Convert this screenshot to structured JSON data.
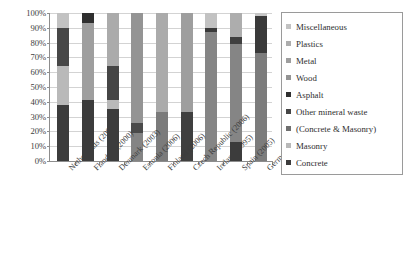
{
  "chart_data": {
    "type": "bar",
    "subtype": "stacked-100-percent",
    "title": "",
    "xlabel": "",
    "ylabel": "",
    "ylim": [
      0,
      100
    ],
    "y_unit": "%",
    "grid": true,
    "legend_position": "right",
    "y_ticks": [
      "0%",
      "10%",
      "20%",
      "30%",
      "40%",
      "50%",
      "60%",
      "70%",
      "80%",
      "90%",
      "100%"
    ],
    "y_tick_values": [
      0,
      10,
      20,
      30,
      40,
      50,
      60,
      70,
      80,
      90,
      100
    ],
    "categories": [
      "Netherlands (2001)",
      "Flanders (2000)",
      "Denmark (2003)",
      "Estonia (2006)",
      "Finland (2006)",
      "Czech Republic (2006)",
      "Ireland (1995)",
      "Spain (2005)",
      "Germany (2007)"
    ],
    "series": [
      {
        "name": "Concrete",
        "color": "#3b3b3b",
        "values": [
          38,
          41,
          35,
          0,
          0,
          33,
          0,
          13,
          0
        ]
      },
      {
        "name": "Masonry",
        "color": "#b7b7b7",
        "values": [
          26,
          0,
          6,
          0,
          0,
          0,
          0,
          0,
          0
        ]
      },
      {
        "name": "(Concrete & Masonry)",
        "color": "#7d7d7d",
        "values": [
          0,
          0,
          0,
          19,
          33,
          0,
          87,
          66,
          73
        ]
      },
      {
        "name": "Other mineral waste",
        "color": "#4a4a4a",
        "values": [
          26,
          0,
          23,
          7,
          0,
          0,
          3,
          5,
          25
        ]
      },
      {
        "name": "Asphalt",
        "color": "#2e2e2e",
        "values": [
          0,
          7,
          0,
          0,
          0,
          0,
          0,
          0,
          0
        ]
      },
      {
        "name": "Wood",
        "color": "#8f8f8f",
        "values": [
          0,
          0,
          0,
          74,
          0,
          0,
          0,
          0,
          0
        ]
      },
      {
        "name": "Metal",
        "color": "#9c9c9c",
        "values": [
          0,
          52,
          0,
          0,
          0,
          67,
          0,
          0,
          0
        ]
      },
      {
        "name": "Plastics",
        "color": "#a8a8a8",
        "values": [
          0,
          0,
          36,
          0,
          67,
          0,
          0,
          16,
          0
        ]
      },
      {
        "name": "Miscellaneous",
        "color": "#c2c2c2",
        "values": [
          10,
          0,
          0,
          0,
          0,
          0,
          10,
          0,
          2
        ]
      }
    ],
    "bars": [
      {
        "category": "Netherlands (2001)",
        "segments": [
          {
            "label": "Miscellaneous",
            "from": 90,
            "to": 100,
            "color": "#c2c2c2"
          },
          {
            "label": "Other mineral waste",
            "from": 64,
            "to": 90,
            "color": "#474747"
          },
          {
            "label": "Masonry",
            "from": 38,
            "to": 64,
            "color": "#b9b9b9"
          },
          {
            "label": "Concrete",
            "from": 0,
            "to": 38,
            "color": "#3c3c3c"
          }
        ]
      },
      {
        "category": "Flanders (2000)",
        "segments": [
          {
            "label": "Asphalt",
            "from": 93,
            "to": 100,
            "color": "#2f2f2f"
          },
          {
            "label": "Metal",
            "from": 41,
            "to": 93,
            "color": "#9e9e9e"
          },
          {
            "label": "Concrete",
            "from": 0,
            "to": 41,
            "color": "#3c3c3c"
          }
        ]
      },
      {
        "category": "Denmark (2003)",
        "segments": [
          {
            "label": "Plastics",
            "from": 64,
            "to": 100,
            "color": "#ababab"
          },
          {
            "label": "Other mineral waste",
            "from": 41,
            "to": 64,
            "color": "#454545"
          },
          {
            "label": "Masonry",
            "from": 35,
            "to": 41,
            "color": "#b9b9b9"
          },
          {
            "label": "Concrete",
            "from": 0,
            "to": 35,
            "color": "#3c3c3c"
          }
        ]
      },
      {
        "category": "Estonia (2006)",
        "segments": [
          {
            "label": "Wood",
            "from": 26,
            "to": 100,
            "color": "#949494"
          },
          {
            "label": "Other mineral waste",
            "from": 19,
            "to": 26,
            "color": "#4a4a4a"
          },
          {
            "label": "(Concrete & Masonry)",
            "from": 0,
            "to": 19,
            "color": "#848484"
          }
        ]
      },
      {
        "category": "Finland (2006)",
        "segments": [
          {
            "label": "Plastics",
            "from": 33,
            "to": 100,
            "color": "#ababab"
          },
          {
            "label": "(Concrete & Masonry)",
            "from": 0,
            "to": 33,
            "color": "#7b7b7b"
          }
        ]
      },
      {
        "category": "Czech Republic (2006)",
        "segments": [
          {
            "label": "Metal",
            "from": 33,
            "to": 100,
            "color": "#9e9e9e"
          },
          {
            "label": "Concrete",
            "from": 0,
            "to": 33,
            "color": "#3f3f3f"
          }
        ]
      },
      {
        "category": "Ireland (1995)",
        "segments": [
          {
            "label": "Miscellaneous",
            "from": 90,
            "to": 100,
            "color": "#c2c2c2"
          },
          {
            "label": "Other mineral waste",
            "from": 87,
            "to": 90,
            "color": "#3a3a3a"
          },
          {
            "label": "(Concrete & Masonry)",
            "from": 0,
            "to": 87,
            "color": "#858585"
          }
        ]
      },
      {
        "category": "Spain (2005)",
        "segments": [
          {
            "label": "Plastics",
            "from": 84,
            "to": 100,
            "color": "#adadad"
          },
          {
            "label": "Other mineral waste",
            "from": 79,
            "to": 84,
            "color": "#3f3f3f"
          },
          {
            "label": "(Concrete & Masonry)",
            "from": 13,
            "to": 79,
            "color": "#858585"
          },
          {
            "label": "Concrete",
            "from": 0,
            "to": 13,
            "color": "#3c3c3c"
          }
        ]
      },
      {
        "category": "Germany (2007)",
        "segments": [
          {
            "label": "Miscellaneous",
            "from": 98,
            "to": 100,
            "color": "#c7c7c7"
          },
          {
            "label": "Other mineral waste",
            "from": 73,
            "to": 98,
            "color": "#3a3a3a"
          },
          {
            "label": "(Concrete & Masonry)",
            "from": 0,
            "to": 73,
            "color": "#7c7c7c"
          }
        ]
      }
    ],
    "legend_entries": [
      {
        "label": "Miscellaneous",
        "color": "#c2c2c2"
      },
      {
        "label": "Plastics",
        "color": "#adadad"
      },
      {
        "label": "Metal",
        "color": "#9e9e9e"
      },
      {
        "label": "Wood",
        "color": "#949494"
      },
      {
        "label": "Asphalt",
        "color": "#2f2f2f"
      },
      {
        "label": "Other mineral waste",
        "color": "#454545"
      },
      {
        "label": "(Concrete & Masonry)",
        "color": "#6f6f6f"
      },
      {
        "label": "Masonry",
        "color": "#b9b9b9"
      },
      {
        "label": "Concrete",
        "color": "#3c3c3c"
      }
    ]
  }
}
